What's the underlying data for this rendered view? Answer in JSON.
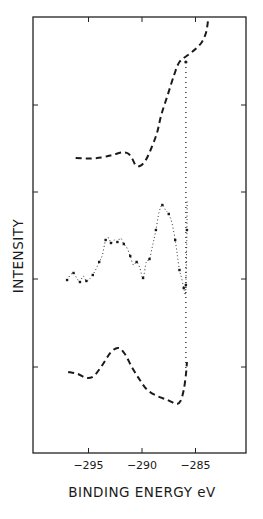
{
  "chart_data": {
    "type": "line",
    "title": "",
    "xlabel": "BINDING ENERGY eV",
    "ylabel": "INTENSITY",
    "xlim": [
      -300,
      -280
    ],
    "x_ticks": [
      -295,
      -290,
      -285
    ],
    "x_tick_labels": [
      "−295",
      "−290",
      "−285"
    ],
    "y_tick_count": 4,
    "y_tick_labels": [],
    "grid": false,
    "legend": null,
    "reference_line": {
      "x": -285.9,
      "style": "dotted-vertical"
    },
    "series": [
      {
        "name": "top curve (dashed)",
        "style": "dashed",
        "points": [
          [
            -296.2,
            158
          ],
          [
            -295.0,
            158.5
          ],
          [
            -293.8,
            157.5
          ],
          [
            -292.8,
            155
          ],
          [
            -291.9,
            152.5
          ],
          [
            -291.3,
            153.5
          ],
          [
            -290.9,
            159
          ],
          [
            -290.6,
            165
          ],
          [
            -290.2,
            166
          ],
          [
            -289.7,
            161
          ],
          [
            -289.2,
            150
          ],
          [
            -288.6,
            133
          ],
          [
            -288.2,
            115
          ],
          [
            -287.6,
            95
          ],
          [
            -287.0,
            75
          ],
          [
            -286.5,
            62
          ],
          [
            -285.7,
            55
          ],
          [
            -285.0,
            49
          ],
          [
            -284.4,
            42
          ],
          [
            -284.0,
            32
          ],
          [
            -283.8,
            18
          ]
        ]
      },
      {
        "name": "middle curve (dotted data)",
        "style": "dotted-markers",
        "points": [
          [
            -297.0,
            280
          ],
          [
            -296.7,
            275
          ],
          [
            -296.4,
            273
          ],
          [
            -296.1,
            278
          ],
          [
            -295.8,
            282
          ],
          [
            -295.5,
            276
          ],
          [
            -295.2,
            281
          ],
          [
            -294.9,
            279
          ],
          [
            -294.6,
            275
          ],
          [
            -294.3,
            269
          ],
          [
            -294.0,
            262
          ],
          [
            -293.7,
            255
          ],
          [
            -293.4,
            240
          ],
          [
            -293.1,
            238
          ],
          [
            -292.9,
            243
          ],
          [
            -292.6,
            240
          ],
          [
            -292.3,
            242
          ],
          [
            -292.0,
            238
          ],
          [
            -291.7,
            244
          ],
          [
            -291.4,
            248
          ],
          [
            -291.1,
            256
          ],
          [
            -290.8,
            265
          ],
          [
            -290.5,
            262
          ],
          [
            -290.2,
            268
          ],
          [
            -289.9,
            278
          ],
          [
            -289.6,
            262
          ],
          [
            -289.3,
            259
          ],
          [
            -289.0,
            245
          ],
          [
            -288.7,
            230
          ],
          [
            -288.4,
            212
          ],
          [
            -288.1,
            205
          ],
          [
            -287.8,
            210
          ],
          [
            -287.5,
            214
          ],
          [
            -287.2,
            223
          ],
          [
            -286.9,
            240
          ],
          [
            -286.7,
            255
          ],
          [
            -286.5,
            270
          ],
          [
            -286.3,
            278
          ],
          [
            -286.1,
            288
          ],
          [
            -285.95,
            295
          ],
          [
            -285.9,
            285
          ],
          [
            -285.85,
            258
          ],
          [
            -285.8,
            230
          ],
          [
            -285.78,
            201
          ]
        ]
      },
      {
        "name": "bottom curve (dashed)",
        "style": "dashed",
        "points": [
          [
            -296.9,
            372
          ],
          [
            -296.0,
            374
          ],
          [
            -295.2,
            378
          ],
          [
            -294.5,
            376
          ],
          [
            -293.7,
            365
          ],
          [
            -292.9,
            352
          ],
          [
            -292.2,
            348
          ],
          [
            -291.6,
            354
          ],
          [
            -290.9,
            368
          ],
          [
            -290.2,
            380
          ],
          [
            -289.5,
            390
          ],
          [
            -288.6,
            396
          ],
          [
            -287.6,
            400
          ],
          [
            -286.8,
            404
          ],
          [
            -286.4,
            401
          ],
          [
            -286.1,
            390
          ],
          [
            -285.9,
            375
          ],
          [
            -285.8,
            362
          ]
        ]
      }
    ],
    "pixel_mapping": {
      "x0_px": 35,
      "x0_val": -300,
      "px_per_eV": 10.7
    }
  }
}
